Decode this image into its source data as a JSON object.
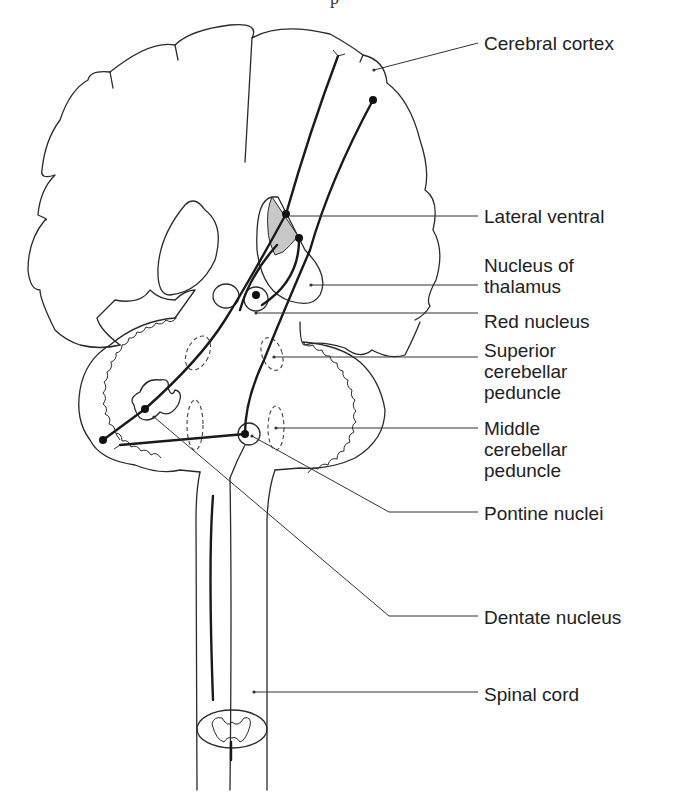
{
  "figure": {
    "header_fragment": "p",
    "labels": [
      {
        "id": "cerebral-cortex",
        "text": "Cerebral cortex",
        "top": 33
      },
      {
        "id": "lateral-ventral",
        "text": "Lateral ventral",
        "top": 208
      },
      {
        "id": "nucleus-of-thalamus",
        "text": "Nucleus of\nthalamus",
        "top": 256
      },
      {
        "id": "red-nucleus",
        "text": "Red nucleus",
        "top": 311
      },
      {
        "id": "superior-cerebellar-peduncle",
        "text": "Superior\ncerebellar\npeduncle",
        "top": 341
      },
      {
        "id": "middle-cerebellar-peduncle",
        "text": "Middle\ncerebellar\npeduncle",
        "top": 420
      },
      {
        "id": "pontine-nuclei",
        "text": "Pontine nuclei",
        "top": 504
      },
      {
        "id": "dentate-nucleus",
        "text": "Dentate nucleus",
        "top": 609
      },
      {
        "id": "spinal-cord",
        "text": "Spinal cord",
        "top": 686
      }
    ]
  }
}
